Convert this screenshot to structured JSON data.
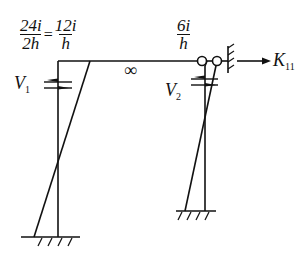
{
  "diagram": {
    "type": "structural frame bending moment diagram",
    "labels": {
      "left_moment_num1": "24i",
      "left_moment_den1": "2h",
      "equals": "=",
      "left_moment_num2": "12i",
      "left_moment_den2": "h",
      "right_moment_num": "6i",
      "right_moment_den": "h",
      "beam_stiffness": "∞",
      "shear_left": "V",
      "shear_left_sub": "1",
      "shear_right": "V",
      "shear_right_sub": "2",
      "stiffness_coeff": "K",
      "stiffness_coeff_sub": "11"
    },
    "colors": {
      "line": "#111111",
      "background": "#ffffff"
    }
  }
}
